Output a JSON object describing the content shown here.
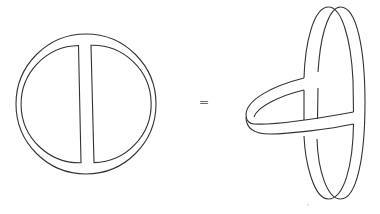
{
  "diagram": {
    "left_figure": {
      "name": "flat theta band (disk with vertical bar)",
      "outer_circle": {
        "cx": 86,
        "cy": 104,
        "r": 70
      },
      "inner_circle": {
        "cx": 86,
        "cy": 104,
        "r": 58
      },
      "bar": {
        "x_left": 79,
        "x_right": 92
      }
    },
    "operator": {
      "symbol": "="
    },
    "right_figure": {
      "name": "3D ring with looping band"
    },
    "stroke_color": "#333333",
    "background": "#ffffff"
  }
}
